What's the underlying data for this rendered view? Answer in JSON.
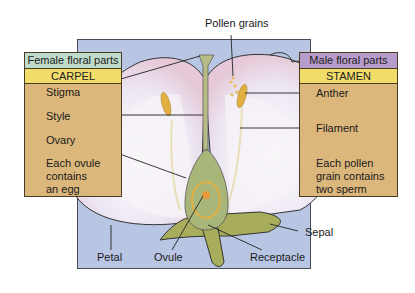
{
  "female_box": {
    "header": "Female floral parts",
    "title": "CARPEL",
    "labels": [
      "Stigma",
      "Style",
      "Ovary"
    ],
    "note_lines": [
      "Each ovule",
      "contains",
      "an egg"
    ]
  },
  "male_box": {
    "header": "Male floral parts",
    "title": "STAMEN",
    "labels": [
      "Anther",
      "Filament"
    ],
    "note_lines": [
      "Each pollen",
      "grain contains",
      "two sperm"
    ]
  },
  "top_label": "Pollen grains",
  "bottom_labels": {
    "petal": "Petal",
    "ovule": "Ovule",
    "receptacle": "Receptacle",
    "sepal": "Sepal"
  },
  "colors": {
    "background_panel": "#b8c6e4",
    "box_fill": "#dcb77c",
    "female_header": "#bfdccb",
    "male_header": "#b89ccc",
    "title_bar": "#f2dd6a"
  }
}
